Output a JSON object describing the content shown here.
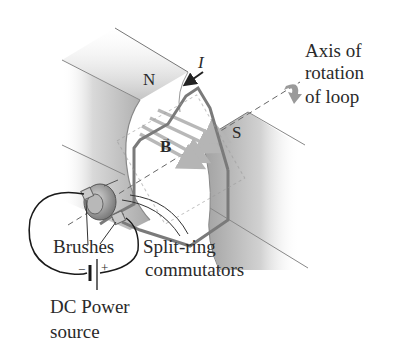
{
  "labels": {
    "north_pole": "N",
    "south_pole": "S",
    "current": "I",
    "field_vector": "B",
    "axis_label_line1": "Axis of",
    "axis_label_line2": "rotation",
    "axis_label_line3": "of loop",
    "brushes": "Brushes",
    "commutator_line1": "Split-ring",
    "commutator_line2": "commutators",
    "power_line1": "DC Power",
    "power_line2": "source",
    "minus_sign": "−",
    "plus_sign": "+"
  },
  "colors": {
    "magnet_light": "#e6e6e6",
    "magnet_dark": "#a9a9a9",
    "loop_wire": "#7a7a7a",
    "field_arrow": "#b8b8b8",
    "text": "#2a2a2a",
    "circuit_wire": "#1a1a1a"
  }
}
